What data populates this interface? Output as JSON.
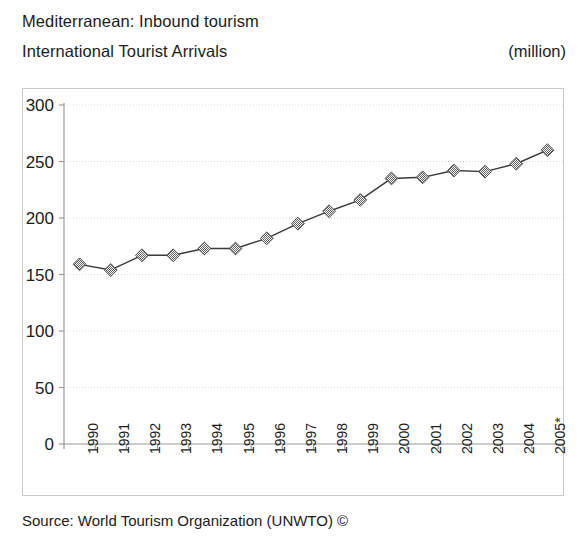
{
  "header": {
    "title_line1": "Mediterranean: Inbound tourism",
    "title_line2": "International Tourist Arrivals",
    "unit": "(million)"
  },
  "footer": {
    "source": "Source: World Tourism Organization (UNWTO) ©"
  },
  "axes": {
    "y_ticks": [
      "300",
      "250",
      "200",
      "150",
      "100",
      "50",
      "0"
    ],
    "x_ticks": [
      "1990",
      "1991",
      "1992",
      "1993",
      "1994",
      "1995",
      "1996",
      "1997",
      "1998",
      "1999",
      "2000",
      "2001",
      "2002",
      "2003",
      "2004",
      "2005*"
    ]
  },
  "colors": {
    "line": "#3a3a3a",
    "marker_fill": "#8a8a8a",
    "marker_edge": "#4a4a4a",
    "frame": "#c9c9c9",
    "gridline": "#dcdcdc",
    "axis": "#9a9a9a",
    "text": "#1c1c1c",
    "plot_background": "#ffffff"
  },
  "chart_data": {
    "type": "line",
    "subtitle": "International Tourist Arrivals",
    "xlabel": "",
    "ylabel": "(million)",
    "ylim": [
      0,
      300
    ],
    "ytick_step": 50,
    "grid": true,
    "grid_style": "dotted horizontal",
    "legend": false,
    "marker": "diamond",
    "note": "2005 value is provisional (indicated by asterisk)",
    "categories": [
      "1990",
      "1991",
      "1992",
      "1993",
      "1994",
      "1995",
      "1996",
      "1997",
      "1998",
      "1999",
      "2000",
      "2001",
      "2002",
      "2003",
      "2004",
      "2005*"
    ],
    "values": [
      159,
      154,
      167,
      167,
      173,
      173,
      182,
      195,
      206,
      216,
      235,
      236,
      242,
      241,
      248,
      260
    ],
    "series": [
      {
        "name": "International Tourist Arrivals",
        "values": [
          159,
          154,
          167,
          167,
          173,
          173,
          182,
          195,
          206,
          216,
          235,
          236,
          242,
          241,
          248,
          260
        ]
      }
    ]
  }
}
